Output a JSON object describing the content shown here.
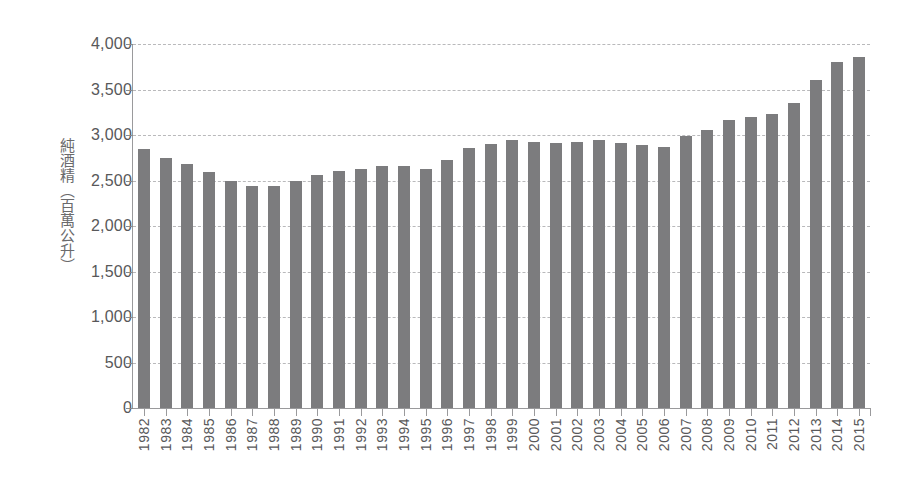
{
  "chart_data": {
    "type": "bar",
    "title": "",
    "subtitle": "",
    "xlabel": "",
    "ylabel": "純酒精（百萬公升）",
    "ylim": [
      0,
      4000
    ],
    "ytick_labels": [
      "4,000",
      "3,500",
      "3,000",
      "2,500",
      "2,000",
      "1,500",
      "1,000",
      "500",
      "0"
    ],
    "ytick_values": [
      4000,
      3500,
      3000,
      2500,
      2000,
      1500,
      1000,
      500,
      0
    ],
    "grid": true,
    "legend": "none",
    "bar_color": "#7c7c7e",
    "gridline_color": "#b9b9bb",
    "axis_color": "#9a9a9c",
    "background_color": "#ffffff",
    "categories": [
      "1982",
      "1983",
      "1984",
      "1985",
      "1986",
      "1987",
      "1988",
      "1989",
      "1990",
      "1991",
      "1992",
      "1993",
      "1994",
      "1995",
      "1996",
      "1997",
      "1998",
      "1999",
      "2000",
      "2001",
      "2002",
      "2003",
      "2004",
      "2005",
      "2006",
      "2007",
      "2008",
      "2009",
      "2010",
      "2011",
      "2012",
      "2013",
      "2014",
      "2015"
    ],
    "values": [
      2845,
      2745,
      2680,
      2595,
      2495,
      2445,
      2445,
      2490,
      2560,
      2605,
      2630,
      2655,
      2665,
      2625,
      2725,
      2855,
      2900,
      2950,
      2920,
      2915,
      2925,
      2940,
      2910,
      2895,
      2870,
      2990,
      3055,
      3165,
      3195,
      3230,
      3355,
      3610,
      3800,
      3860
    ]
  }
}
